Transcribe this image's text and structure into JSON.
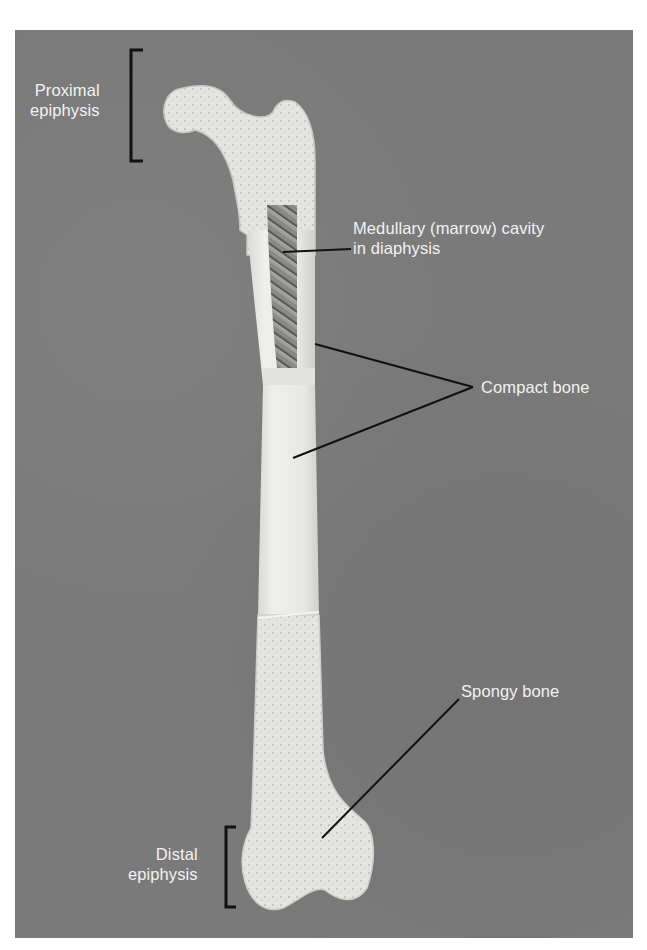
{
  "figure": {
    "background_color": "#7a7a7a",
    "bone_color": "#e6e6e2",
    "label_color": "#f2f2f2",
    "leader_line_color": "#111111"
  },
  "labels": {
    "proximal_epiphysis": {
      "line1": "Proximal",
      "line2": "epiphysis"
    },
    "medullary_cavity": {
      "line1": "Medullary (marrow) cavity",
      "line2": "in diaphysis"
    },
    "compact_bone": {
      "text": "Compact bone"
    },
    "spongy_bone": {
      "text": "Spongy bone"
    },
    "distal_epiphysis": {
      "line1": "Distal",
      "line2": "epiphysis"
    }
  }
}
